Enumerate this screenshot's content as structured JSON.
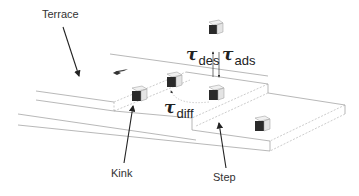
{
  "figure": {
    "type": "surface-growth-schematic",
    "labels": {
      "terrace": "Terrace",
      "kink": "Kink",
      "step": "Step"
    },
    "rates": [
      {
        "id": "desorption",
        "symbol": "τ",
        "subscript": "des"
      },
      {
        "id": "adsorption",
        "symbol": "τ",
        "subscript": "ads"
      },
      {
        "id": "diffusion",
        "symbol": "τ",
        "subscript": "diff"
      }
    ],
    "colors": {
      "line": "#888888",
      "dashed": "#999999",
      "arrow": "#222222",
      "cube_front": "#2a2a2a",
      "cube_side": "#e6e6e6",
      "cube_top": "#f2f2f2"
    },
    "atoms": [
      {
        "id": "adatom-above",
        "description": "atom above surface (desorbed/arriving)"
      },
      {
        "id": "adatom-step-edge",
        "description": "atom at step edge"
      },
      {
        "id": "adatom-kink",
        "description": "atom at kink site"
      },
      {
        "id": "adatom-terrace-upper",
        "description": "diffusing atom on terrace"
      },
      {
        "id": "adatom-terrace-lower",
        "description": "atom on lower terrace"
      }
    ]
  }
}
